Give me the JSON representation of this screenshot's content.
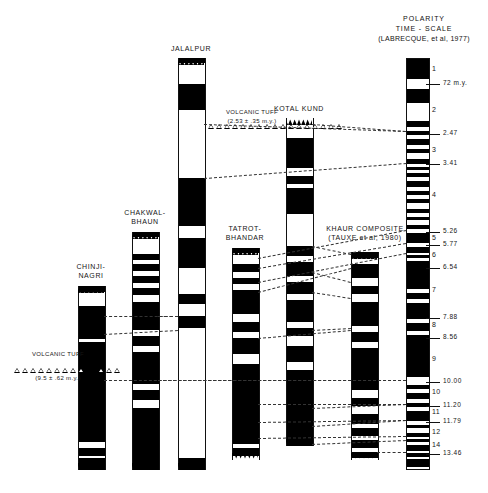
{
  "figure": {
    "type": "magnetostratigraphic-correlation-chart",
    "reference_header": {
      "line1": "POLARITY",
      "line2": "TIME - SCALE",
      "line3": "(LABRECQUE, et al, 1977)"
    }
  },
  "sections": [
    {
      "id": "chinji-nagri",
      "name_lines": [
        "CHINJI-",
        "NAGRI"
      ],
      "x": 78,
      "y": 286,
      "width": 26,
      "height": 184,
      "bands": [
        [
          0,
          6
        ],
        [
          20,
          33
        ],
        [
          39,
          8
        ],
        [
          56,
          100
        ],
        [
          162,
          8
        ],
        [
          172,
          12
        ]
      ]
    },
    {
      "id": "chakwal-bhaun",
      "name_lines": [
        "CHAKWAL-",
        "BHAUN"
      ],
      "x": 132,
      "y": 232,
      "width": 26,
      "height": 238,
      "bands": [
        [
          0,
          5
        ],
        [
          22,
          6
        ],
        [
          32,
          7
        ],
        [
          44,
          7
        ],
        [
          56,
          7
        ],
        [
          70,
          28
        ],
        [
          104,
          10
        ],
        [
          120,
          32
        ],
        [
          158,
          10
        ],
        [
          176,
          62
        ]
      ]
    },
    {
      "id": "jalalpur",
      "name_lines": [
        "JALALPUR"
      ],
      "x": 178,
      "y": 58,
      "width": 26,
      "height": 412,
      "bands": [
        [
          0,
          5
        ],
        [
          26,
          26
        ],
        [
          120,
          48
        ],
        [
          180,
          30
        ],
        [
          236,
          10
        ],
        [
          258,
          12
        ],
        [
          400,
          12
        ]
      ]
    },
    {
      "id": "tatrot-bhandar",
      "name_lines": [
        "TATROT-",
        "BHANDAR"
      ],
      "x": 232,
      "y": 248,
      "width": 26,
      "height": 212,
      "bands": [
        [
          0,
          5
        ],
        [
          16,
          8
        ],
        [
          30,
          6
        ],
        [
          42,
          24
        ],
        [
          74,
          10
        ],
        [
          90,
          16
        ],
        [
          116,
          80
        ],
        [
          200,
          8
        ]
      ]
    },
    {
      "id": "kotal-kund",
      "name_lines": [
        "KOTAL KUND"
      ],
      "x": 286,
      "y": 118,
      "width": 26,
      "height": 328,
      "bands": [
        [
          20,
          30
        ],
        [
          58,
          8
        ],
        [
          70,
          26
        ],
        [
          128,
          10
        ],
        [
          144,
          14
        ],
        [
          164,
          12
        ],
        [
          182,
          22
        ],
        [
          210,
          8
        ],
        [
          228,
          16
        ],
        [
          252,
          80
        ],
        [
          342,
          6
        ],
        [
          352,
          14
        ]
      ]
    },
    {
      "id": "khaur-composite",
      "name_lines": [
        "KHAUR COMPOSITE",
        "(TAUXE et al, 1980)"
      ],
      "x": 351,
      "y": 252,
      "width": 26,
      "height": 208,
      "bands": [
        [
          0,
          6
        ],
        [
          12,
          14
        ],
        [
          34,
          8
        ],
        [
          50,
          24
        ],
        [
          80,
          10
        ],
        [
          96,
          42
        ],
        [
          146,
          8
        ],
        [
          162,
          10
        ],
        [
          176,
          8
        ],
        [
          188,
          8
        ],
        [
          200,
          6
        ]
      ]
    }
  ],
  "volcanic_tuffs": [
    {
      "id": "tuff-upper",
      "label_line1": "VOLCANIC TUFF",
      "label_line2": "(2.53 ± .35 m.y.)",
      "x": 212,
      "y": 108,
      "marker_count": 14,
      "marker_x": 208,
      "marker_y": 124
    },
    {
      "id": "tuff-upper-right",
      "label_line1": "",
      "label_line2": "",
      "x": 320,
      "y": 124,
      "marker_count": 3,
      "marker_x": 320,
      "marker_y": 124
    },
    {
      "id": "tuff-lower",
      "label_line1": "VOLCANIC TUFF",
      "label_line2": "(9.5 ± .62 m.y.)",
      "x": 18,
      "y": 350,
      "marker_count": 9,
      "marker_x": 14,
      "marker_y": 368
    },
    {
      "id": "tuff-lower-right",
      "label_line1": "",
      "label_line2": "",
      "x": 98,
      "y": 368,
      "marker_count": 3,
      "marker_x": 98,
      "marker_y": 368
    }
  ],
  "chart_data": {
    "type": "table",
    "title": "POLARITY TIME - SCALE (LABRECQUE, et al, 1977)",
    "xlabel": "",
    "ylabel": "Age (m.y.)",
    "ylim": [
      0,
      13.46
    ],
    "chron_labels": [
      "1",
      "2",
      "2A",
      "3",
      "4",
      "5",
      "6",
      "7",
      "8",
      "9",
      "10",
      "11",
      "12",
      "14"
    ],
    "age_ticks": [
      {
        "value": "72 m.y.",
        "y": 84
      },
      {
        "value": "2.47",
        "y": 134
      },
      {
        "value": "3.41",
        "y": 164
      },
      {
        "value": "5.26",
        "y": 232
      },
      {
        "value": "5.77",
        "y": 245
      },
      {
        "value": "6.54",
        "y": 268
      },
      {
        "value": "7.88",
        "y": 318
      },
      {
        "value": "8.56",
        "y": 338
      },
      {
        "value": "10.00",
        "y": 382
      },
      {
        "value": "11.20",
        "y": 406
      },
      {
        "value": "11.79",
        "y": 422
      },
      {
        "value": "13.46",
        "y": 454
      }
    ],
    "chron_positions": [
      {
        "label": "1",
        "y": 70
      },
      {
        "label": "2",
        "y": 111
      },
      {
        "label": "3",
        "y": 151
      },
      {
        "label": "4",
        "y": 196
      },
      {
        "label": "5",
        "y": 239
      },
      {
        "label": "6",
        "y": 256
      },
      {
        "label": "7",
        "y": 291
      },
      {
        "label": "8",
        "y": 326
      },
      {
        "label": "9",
        "y": 360
      },
      {
        "label": "10",
        "y": 393
      },
      {
        "label": "11",
        "y": 413
      },
      {
        "label": "12",
        "y": 433
      },
      {
        "label": "14",
        "y": 446
      }
    ],
    "reference_column": {
      "x": 406,
      "y": 58,
      "width": 22,
      "height": 410,
      "normal_bands": [
        [
          0,
          20
        ],
        [
          30,
          14
        ],
        [
          62,
          6
        ],
        [
          72,
          4
        ],
        [
          80,
          6
        ],
        [
          90,
          4
        ],
        [
          100,
          5
        ],
        [
          108,
          3
        ],
        [
          114,
          4
        ],
        [
          122,
          6
        ],
        [
          132,
          4
        ],
        [
          140,
          4
        ],
        [
          150,
          4
        ],
        [
          158,
          3
        ],
        [
          166,
          4
        ],
        [
          174,
          10
        ],
        [
          188,
          6
        ],
        [
          196,
          3
        ],
        [
          202,
          28
        ],
        [
          234,
          6
        ],
        [
          244,
          16
        ],
        [
          264,
          8
        ],
        [
          276,
          42
        ],
        [
          326,
          4
        ],
        [
          334,
          6
        ],
        [
          344,
          4
        ],
        [
          352,
          10
        ],
        [
          366,
          3
        ],
        [
          374,
          4
        ],
        [
          380,
          3
        ],
        [
          386,
          6
        ],
        [
          394,
          4
        ],
        [
          400,
          8
        ]
      ]
    }
  },
  "correlation_lines": [
    {
      "x1": 204,
      "y1": 124,
      "x2": 406,
      "y2": 131
    },
    {
      "x1": 312,
      "y1": 124,
      "x2": 406,
      "y2": 131
    },
    {
      "x1": 204,
      "y1": 178,
      "x2": 406,
      "y2": 163
    },
    {
      "x1": 258,
      "y1": 258,
      "x2": 406,
      "y2": 230
    },
    {
      "x1": 258,
      "y1": 268,
      "x2": 406,
      "y2": 243
    },
    {
      "x1": 258,
      "y1": 282,
      "x2": 406,
      "y2": 253
    },
    {
      "x1": 258,
      "y1": 292,
      "x2": 351,
      "y2": 268
    },
    {
      "x1": 312,
      "y1": 246,
      "x2": 351,
      "y2": 254
    },
    {
      "x1": 312,
      "y1": 272,
      "x2": 351,
      "y2": 282
    },
    {
      "x1": 312,
      "y1": 292,
      "x2": 351,
      "y2": 298
    },
    {
      "x1": 104,
      "y1": 316,
      "x2": 178,
      "y2": 316
    },
    {
      "x1": 104,
      "y1": 334,
      "x2": 178,
      "y2": 330
    },
    {
      "x1": 158,
      "y1": 316,
      "x2": 178,
      "y2": 316
    },
    {
      "x1": 258,
      "y1": 338,
      "x2": 351,
      "y2": 330
    },
    {
      "x1": 312,
      "y1": 330,
      "x2": 351,
      "y2": 328
    },
    {
      "x1": 104,
      "y1": 380,
      "x2": 406,
      "y2": 380
    },
    {
      "x1": 158,
      "y1": 380,
      "x2": 406,
      "y2": 380
    },
    {
      "x1": 258,
      "y1": 404,
      "x2": 406,
      "y2": 404
    },
    {
      "x1": 312,
      "y1": 408,
      "x2": 406,
      "y2": 404
    },
    {
      "x1": 258,
      "y1": 422,
      "x2": 406,
      "y2": 420
    },
    {
      "x1": 312,
      "y1": 426,
      "x2": 406,
      "y2": 420
    },
    {
      "x1": 258,
      "y1": 438,
      "x2": 406,
      "y2": 436
    },
    {
      "x1": 312,
      "y1": 444,
      "x2": 406,
      "y2": 440
    },
    {
      "x1": 377,
      "y1": 452,
      "x2": 406,
      "y2": 452
    }
  ]
}
